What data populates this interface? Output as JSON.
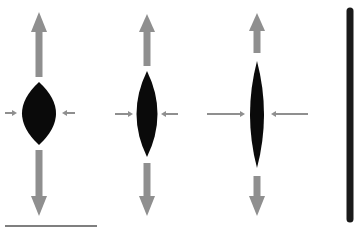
{
  "figure": {
    "colors": {
      "background": "#ffffff",
      "lens": "#0a0a0a",
      "arrow": "#8f8f8f",
      "scale_bar": "#555555",
      "vertical_line": "#1a1a1a"
    },
    "panels": [
      {
        "id": "lens-1",
        "lens": {
          "cx": 39,
          "top": 82,
          "bottom": 145,
          "half_width": 17
        },
        "up_arrow": {
          "x": 39,
          "tip_y": 12,
          "head_base_y": 32,
          "shaft_end_y": 77,
          "shaft_width": 7,
          "head_width": 16
        },
        "down_arrow": {
          "x": 39,
          "shaft_start_y": 150,
          "head_base_y": 196,
          "tip_y": 216,
          "shaft_width": 7,
          "head_width": 16
        },
        "left_arrow": {
          "y": 113,
          "x_start": 5,
          "x_tip": 17
        },
        "right_arrow": {
          "y": 113,
          "x_start": 75,
          "x_tip": 62
        }
      },
      {
        "id": "lens-2",
        "lens": {
          "cx": 147,
          "top": 71,
          "bottom": 157,
          "half_width": 10.5
        },
        "up_arrow": {
          "x": 147,
          "tip_y": 14,
          "head_base_y": 32,
          "shaft_end_y": 66,
          "shaft_width": 7,
          "head_width": 16
        },
        "down_arrow": {
          "x": 147,
          "shaft_start_y": 163,
          "head_base_y": 196,
          "tip_y": 216,
          "shaft_width": 7,
          "head_width": 16
        },
        "left_arrow": {
          "y": 114,
          "x_start": 115,
          "x_tip": 133
        },
        "right_arrow": {
          "y": 114,
          "x_start": 178,
          "x_tip": 161
        }
      },
      {
        "id": "lens-3",
        "lens": {
          "cx": 257,
          "top": 61,
          "bottom": 168,
          "half_width": 7
        },
        "up_arrow": {
          "x": 257,
          "tip_y": 13,
          "head_base_y": 31,
          "shaft_end_y": 53,
          "shaft_width": 7,
          "head_width": 16
        },
        "down_arrow": {
          "x": 257,
          "shaft_start_y": 176,
          "head_base_y": 196,
          "tip_y": 216,
          "shaft_width": 7,
          "head_width": 16
        },
        "left_arrow": {
          "y": 114,
          "x_start": 207,
          "x_tip": 245
        },
        "right_arrow": {
          "y": 114,
          "x_start": 308,
          "x_tip": 271
        }
      }
    ],
    "scale_bar": {
      "x1": 5,
      "x2": 97,
      "y": 226
    },
    "vertical_line": {
      "x": 350,
      "y1": 11,
      "y2": 219,
      "width": 7
    }
  }
}
